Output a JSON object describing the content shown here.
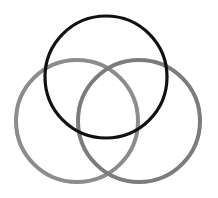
{
  "diagram": {
    "type": "venn",
    "background": "#ffffff",
    "circles": [
      {
        "name": "top",
        "cx": 106,
        "cy": 77,
        "r": 61,
        "stroke": "#111111",
        "stroke_width": 3.2
      },
      {
        "name": "bottom-left",
        "cx": 77,
        "cy": 121,
        "r": 61,
        "stroke": "#8c8c8c",
        "stroke_width": 4
      },
      {
        "name": "bottom-right",
        "cx": 139,
        "cy": 121,
        "r": 61,
        "stroke": "#7c7c7c",
        "stroke_width": 4
      }
    ]
  }
}
